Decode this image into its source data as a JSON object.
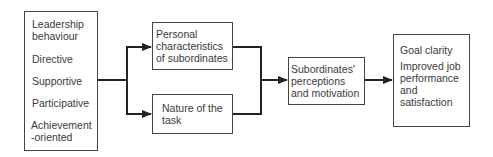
{
  "diagram": {
    "leadership_box": {
      "title_lines": [
        "Leadership",
        "behaviour"
      ],
      "items": [
        "Directive",
        "Supportive",
        "Participative",
        "Achievement",
        "-oriented"
      ]
    },
    "personal_box": {
      "lines": [
        "Personal",
        "characteristics",
        "of subordinates"
      ]
    },
    "task_box": {
      "lines": [
        "Nature of the",
        "task"
      ]
    },
    "perceptions_box": {
      "lines": [
        "Subordinates'",
        "perceptions",
        "and motivation"
      ]
    },
    "outcomes_box": {
      "line1": "Goal clarity",
      "lines": [
        "Improved job",
        "performance",
        "and",
        "satisfaction"
      ]
    },
    "connector_color": "#222222"
  }
}
